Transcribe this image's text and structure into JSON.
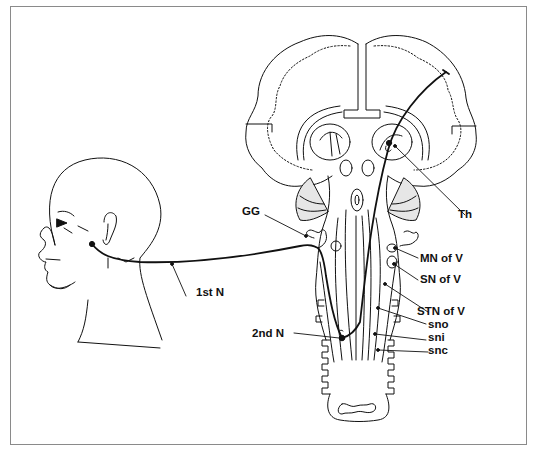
{
  "figure": {
    "labels": {
      "gg": "GG",
      "th": "Th",
      "mn_of_v": "MN of V",
      "sn_of_v": "SN of V",
      "stn_of_v": "STN of V",
      "sno": "sno",
      "sni": "sni",
      "snc": "snc",
      "first_n": "1st N",
      "second_n": "2nd N"
    },
    "colors": {
      "line": "#111111",
      "frame": "#8a8a8a",
      "shade": "#e6e6e6",
      "background": "#ffffff"
    }
  }
}
